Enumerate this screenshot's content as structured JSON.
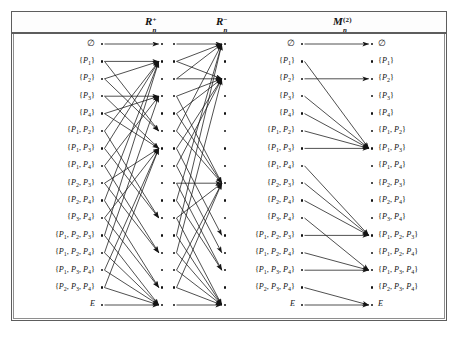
{
  "figure": {
    "caption": "",
    "background": "#ffffff",
    "ink": "#151515",
    "frame_color": "#5d5d5d"
  },
  "columns": [
    {
      "id": "R_plus",
      "label_base": "R",
      "label_sub": "n",
      "label_sup": "+",
      "title_text": "R n +"
    },
    {
      "id": "R_minus",
      "label_base": "R",
      "label_sub": "n",
      "label_sup": "−",
      "title_text": "R n −"
    },
    {
      "id": "M_2",
      "label_base": "M",
      "label_sub": "n",
      "label_sup": "(2)",
      "title_text": "M n (2)"
    }
  ],
  "subsets": [
    "∅",
    "{P₁}",
    "{P₂}",
    "{P₃}",
    "{P₄}",
    "{P₁, P₂}",
    "{P₁, P₃}",
    "{P₁, P₄}",
    "{P₂, P₃}",
    "{P₂, P₄}",
    "{P₃, P₄}",
    "{P₁, P₂, P₃}",
    "{P₁, P₂, P₄}",
    "{P₁, P₃, P₄}",
    "{P₂, P₃, P₄}",
    "E"
  ],
  "label_groups": {
    "left_labels_column": "subsets",
    "middle_labels_column": "subsets",
    "right_labels_column": "subsets"
  },
  "chart_data": {
    "type": "diagram",
    "title": "",
    "node_count_per_column": 16,
    "panels": [
      {
        "name": "R_plus",
        "edges": [
          [
            0,
            0
          ],
          [
            1,
            1
          ],
          [
            1,
            5
          ],
          [
            2,
            1
          ],
          [
            2,
            5
          ],
          [
            3,
            3
          ],
          [
            3,
            6
          ],
          [
            4,
            3
          ],
          [
            4,
            6
          ],
          [
            5,
            1
          ],
          [
            5,
            10
          ],
          [
            6,
            1
          ],
          [
            6,
            10
          ],
          [
            7,
            3
          ],
          [
            7,
            12
          ],
          [
            8,
            6
          ],
          [
            8,
            12
          ],
          [
            9,
            1
          ],
          [
            9,
            14
          ],
          [
            10,
            6
          ],
          [
            10,
            14
          ],
          [
            11,
            1
          ],
          [
            11,
            15
          ],
          [
            12,
            3
          ],
          [
            12,
            15
          ],
          [
            13,
            6
          ],
          [
            13,
            15
          ],
          [
            14,
            6
          ],
          [
            14,
            15
          ],
          [
            15,
            15
          ]
        ]
      },
      {
        "name": "R_minus",
        "edges": [
          [
            0,
            0
          ],
          [
            1,
            0
          ],
          [
            1,
            2
          ],
          [
            2,
            0
          ],
          [
            2,
            2
          ],
          [
            3,
            2
          ],
          [
            3,
            8
          ],
          [
            4,
            2
          ],
          [
            4,
            8
          ],
          [
            5,
            0
          ],
          [
            5,
            8
          ],
          [
            6,
            2
          ],
          [
            6,
            11
          ],
          [
            7,
            2
          ],
          [
            7,
            12
          ],
          [
            8,
            8
          ],
          [
            8,
            13
          ],
          [
            9,
            0
          ],
          [
            9,
            13
          ],
          [
            10,
            8
          ],
          [
            10,
            15
          ],
          [
            11,
            0
          ],
          [
            11,
            15
          ],
          [
            12,
            2
          ],
          [
            12,
            15
          ],
          [
            13,
            8
          ],
          [
            13,
            15
          ],
          [
            14,
            8
          ],
          [
            14,
            15
          ],
          [
            15,
            15
          ]
        ]
      },
      {
        "name": "M_2",
        "edges": [
          [
            0,
            0
          ],
          [
            1,
            6
          ],
          [
            2,
            2
          ],
          [
            3,
            6
          ],
          [
            4,
            6
          ],
          [
            5,
            6
          ],
          [
            6,
            6
          ],
          [
            7,
            11
          ],
          [
            8,
            11
          ],
          [
            9,
            11
          ],
          [
            10,
            13
          ],
          [
            11,
            11
          ],
          [
            12,
            13
          ],
          [
            13,
            13
          ],
          [
            14,
            15
          ],
          [
            15,
            15
          ]
        ]
      }
    ]
  }
}
